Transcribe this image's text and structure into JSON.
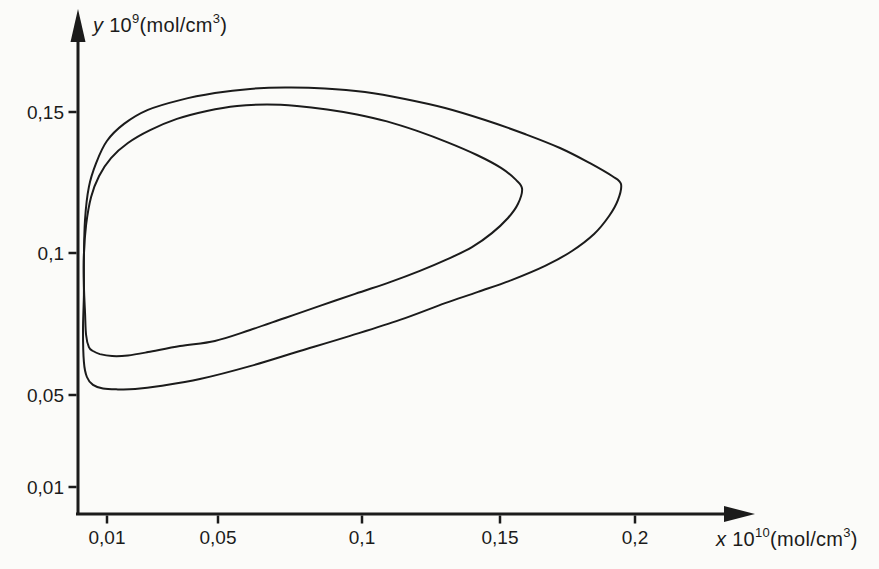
{
  "figure": {
    "background": "#fbfbf9",
    "ink_color": "#1b1b1b"
  },
  "chart_data": {
    "type": "line",
    "title": "",
    "xlabel": "x 10^10 (mol/cm^3)",
    "ylabel": "y 10^9 (mol/cm^3)",
    "xlabel_parts": {
      "variable": "x",
      "base": " 10",
      "exponent": "10",
      "unit": "(mol/cm",
      "unit_exponent": "3",
      "close": ")"
    },
    "ylabel_parts": {
      "variable": "y",
      "base": " 10",
      "exponent": "9",
      "unit": "(mol/cm",
      "unit_exponent": "3",
      "close": ")"
    },
    "decimal_separator": ",",
    "grid": false,
    "legend": null,
    "xlim": [
      0,
      0.235
    ],
    "ylim": [
      0,
      0.18
    ],
    "x_ticks": [
      {
        "label": "0,01",
        "value": 0.01,
        "px": 107
      },
      {
        "label": "0,05",
        "value": 0.05,
        "px": 218
      },
      {
        "label": "0,1",
        "value": 0.1,
        "px": 362
      },
      {
        "label": "0,15",
        "value": 0.15,
        "px": 500
      },
      {
        "label": "0,2",
        "value": 0.2,
        "px": 635
      }
    ],
    "y_ticks": [
      {
        "label": "0,15",
        "value": 0.15,
        "py": 112
      },
      {
        "label": "0,1",
        "value": 0.1,
        "py": 253
      },
      {
        "label": "0,05",
        "value": 0.05,
        "py": 395
      },
      {
        "label": "0,01",
        "value": 0.01,
        "py": 487
      }
    ],
    "calibration": {
      "x_origin_px": 80,
      "px_per_x_unit": 2770,
      "y_ref_value": 0.1,
      "y_ref_px": 253,
      "px_per_y_unit": 2800
    },
    "axes_layout": {
      "y_axis_x": 78,
      "x_axis_y": 514,
      "x_axis_start": 76,
      "x_axis_end": 727,
      "x_arrow_tip": 755,
      "y_axis_top": 40,
      "y_arrow_tip": 9,
      "arrow_half_width": 7.5,
      "tick_length": 8,
      "axis_stroke": 3,
      "tick_stroke": 2.5,
      "curve_stroke": 2,
      "tick_label_font": 19
    },
    "series": [
      {
        "name": "outer closed trajectory",
        "points": [
          [
            0.0025,
            0.0557
          ],
          [
            0.0014,
            0.0611
          ],
          [
            0.0011,
            0.0725
          ],
          [
            0.0014,
            0.085
          ],
          [
            0.0014,
            0.0982
          ],
          [
            0.0018,
            0.1118
          ],
          [
            0.0032,
            0.1236
          ],
          [
            0.0058,
            0.1321
          ],
          [
            0.0097,
            0.14
          ],
          [
            0.0159,
            0.1461
          ],
          [
            0.0245,
            0.1511
          ],
          [
            0.0361,
            0.1546
          ],
          [
            0.0487,
            0.1571
          ],
          [
            0.0614,
            0.1586
          ],
          [
            0.074,
            0.1591
          ],
          [
            0.0884,
            0.1588
          ],
          [
            0.1029,
            0.1575
          ],
          [
            0.1173,
            0.155
          ],
          [
            0.1318,
            0.1518
          ],
          [
            0.1462,
            0.1475
          ],
          [
            0.1606,
            0.1425
          ],
          [
            0.1733,
            0.1375
          ],
          [
            0.1841,
            0.1321
          ],
          [
            0.1921,
            0.1275
          ],
          [
            0.1953,
            0.1246
          ],
          [
            0.1942,
            0.1189
          ],
          [
            0.191,
            0.1132
          ],
          [
            0.1856,
            0.1068
          ],
          [
            0.1776,
            0.1007
          ],
          [
            0.1679,
            0.0954
          ],
          [
            0.156,
            0.0904
          ],
          [
            0.1437,
            0.0861
          ],
          [
            0.1318,
            0.0821
          ],
          [
            0.1155,
            0.0761
          ],
          [
            0.0975,
            0.0704
          ],
          [
            0.0794,
            0.065
          ],
          [
            0.0614,
            0.0596
          ],
          [
            0.0433,
            0.055
          ],
          [
            0.0289,
            0.0525
          ],
          [
            0.0199,
            0.0514
          ],
          [
            0.0137,
            0.0513
          ],
          [
            0.0083,
            0.0516
          ],
          [
            0.0047,
            0.0529
          ]
        ]
      },
      {
        "name": "inner closed trajectory",
        "points": [
          [
            0.0032,
            0.0664
          ],
          [
            0.0022,
            0.0707
          ],
          [
            0.0018,
            0.0789
          ],
          [
            0.0014,
            0.0886
          ],
          [
            0.0014,
            0.0993
          ],
          [
            0.0022,
            0.11
          ],
          [
            0.004,
            0.12
          ],
          [
            0.0069,
            0.1275
          ],
          [
            0.0112,
            0.1339
          ],
          [
            0.0173,
            0.1393
          ],
          [
            0.0253,
            0.1439
          ],
          [
            0.035,
            0.1479
          ],
          [
            0.0458,
            0.1507
          ],
          [
            0.0567,
            0.1525
          ],
          [
            0.0675,
            0.153
          ],
          [
            0.0783,
            0.1525
          ],
          [
            0.0892,
            0.1513
          ],
          [
            0.1,
            0.1495
          ],
          [
            0.1108,
            0.147
          ],
          [
            0.1217,
            0.1436
          ],
          [
            0.1325,
            0.1396
          ],
          [
            0.1433,
            0.135
          ],
          [
            0.152,
            0.1304
          ],
          [
            0.1574,
            0.1261
          ],
          [
            0.1596,
            0.1229
          ],
          [
            0.1581,
            0.1175
          ],
          [
            0.1545,
            0.1125
          ],
          [
            0.1487,
            0.1071
          ],
          [
            0.1415,
            0.1021
          ],
          [
            0.1329,
            0.0979
          ],
          [
            0.1227,
            0.0936
          ],
          [
            0.1119,
            0.0896
          ],
          [
            0.0993,
            0.0854
          ],
          [
            0.0866,
            0.0811
          ],
          [
            0.074,
            0.0768
          ],
          [
            0.0614,
            0.0725
          ],
          [
            0.0487,
            0.0686
          ],
          [
            0.0361,
            0.0668
          ],
          [
            0.0246,
            0.0646
          ],
          [
            0.0173,
            0.0634
          ],
          [
            0.0116,
            0.0632
          ],
          [
            0.0072,
            0.0639
          ],
          [
            0.0047,
            0.065
          ]
        ]
      }
    ]
  }
}
